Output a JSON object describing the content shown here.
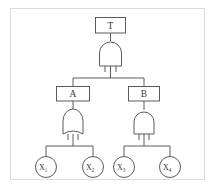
{
  "diagram": {
    "kind": "fault-tree",
    "title": "",
    "colors": {
      "stroke": "#4a4a4a",
      "frame": "#dcdcdc",
      "background": "#ffffff",
      "text": "#3a3a3a"
    },
    "top_event": {
      "id": "T",
      "label": "T",
      "shape": "rectangle"
    },
    "intermediate_events": [
      {
        "id": "A",
        "label": "A",
        "shape": "rectangle",
        "side": "left"
      },
      {
        "id": "B",
        "label": "B",
        "shape": "rectangle",
        "side": "right"
      }
    ],
    "gates": [
      {
        "id": "gate-top",
        "type": "AND",
        "output": "T",
        "inputs": [
          "A",
          "B"
        ]
      },
      {
        "id": "gate-a",
        "type": "OR",
        "output": "A",
        "inputs": [
          "X1",
          "X2"
        ]
      },
      {
        "id": "gate-b",
        "type": "AND",
        "output": "B",
        "inputs": [
          "X3",
          "X4"
        ]
      }
    ],
    "basic_events": [
      {
        "id": "X1",
        "label": "X",
        "subscript": "1",
        "shape": "circle"
      },
      {
        "id": "X2",
        "label": "X",
        "subscript": "2",
        "shape": "circle"
      },
      {
        "id": "X3",
        "label": "X",
        "subscript": "3",
        "shape": "circle"
      },
      {
        "id": "X4",
        "label": "X",
        "subscript": "4",
        "shape": "circle"
      }
    ]
  }
}
